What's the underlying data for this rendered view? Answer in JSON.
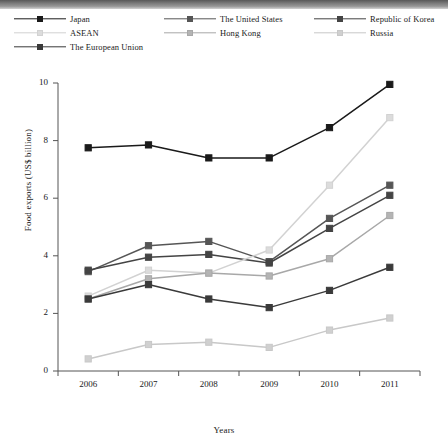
{
  "chart_data": {
    "type": "line",
    "title": "",
    "xlabel": "Years",
    "ylabel": "Food exports (US$ billion)",
    "x": [
      "2006",
      "2007",
      "2008",
      "2009",
      "2010",
      "2011"
    ],
    "categories": [
      "2006",
      "2007",
      "2008",
      "2009",
      "2010",
      "2011"
    ],
    "xtick_labels": [
      "2006",
      "2007",
      "2008",
      "2009",
      "2010",
      "2011"
    ],
    "ytick_labels": [
      "0",
      "2",
      "4",
      "6",
      "8",
      "10"
    ],
    "yticks": [
      0,
      2,
      4,
      6,
      8,
      10
    ],
    "ylim": [
      0,
      10
    ],
    "grid": false,
    "legend_position": "top",
    "marker": "square",
    "series": [
      {
        "name": "Japan",
        "color": "#1a1a1a",
        "marker_fill": "#1a1a1a",
        "values": [
          7.75,
          7.85,
          7.4,
          7.4,
          8.45,
          9.95
        ]
      },
      {
        "name": "The United States",
        "color": "#565656",
        "marker_fill": "#565656",
        "values": [
          3.45,
          4.35,
          4.5,
          3.8,
          5.3,
          6.45
        ]
      },
      {
        "name": "Republic of Korea",
        "color": "#444444",
        "marker_fill": "#444444",
        "values": [
          3.5,
          3.95,
          4.05,
          3.75,
          4.95,
          6.1
        ]
      },
      {
        "name": "ASEAN",
        "color": "#d2d2d2",
        "marker_fill": "#dcdcdc",
        "values": [
          2.6,
          3.5,
          3.4,
          4.2,
          6.45,
          8.8
        ]
      },
      {
        "name": "Hong Kong",
        "color": "#a8a8a8",
        "marker_fill": "#b4b4b4",
        "values": [
          2.5,
          3.2,
          3.4,
          3.3,
          3.9,
          5.4
        ]
      },
      {
        "name": "Russia",
        "color": "#c8c8c8",
        "marker_fill": "#d0d0d0",
        "values": [
          0.42,
          0.92,
          1.0,
          0.82,
          1.42,
          1.84
        ]
      },
      {
        "name": "The European Union",
        "color": "#3a3a3a",
        "marker_fill": "#3a3a3a",
        "values": [
          2.5,
          3.0,
          2.5,
          2.2,
          2.8,
          3.6
        ]
      }
    ]
  },
  "legend": {
    "rows": [
      [
        {
          "label": "Japan",
          "series": 0
        },
        {
          "label": "The United States",
          "series": 1
        },
        {
          "label": "Republic of Korea",
          "series": 2
        }
      ],
      [
        {
          "label": "ASEAN",
          "series": 3
        },
        {
          "label": "Hong Kong",
          "series": 4
        },
        {
          "label": "Russia",
          "series": 5
        }
      ],
      [
        {
          "label": "The European Union",
          "series": 6
        }
      ]
    ]
  }
}
